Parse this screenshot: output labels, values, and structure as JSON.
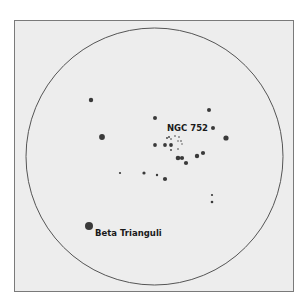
{
  "colors": {
    "background": "#ffffff",
    "field": "#ededed",
    "frame": "#7a7a7a",
    "circle": "#555555",
    "star": "#3a3a3a",
    "label": "#1a1a1a"
  },
  "field_of_view": {
    "cx": 154.5,
    "cy": 156.5,
    "r": 128.5
  },
  "labels": [
    {
      "id": "ngc752",
      "text": "NGC 752",
      "x": 167,
      "y": 131
    },
    {
      "id": "beta-tri",
      "text": "Beta Trianguli",
      "x": 95,
      "y": 236
    }
  ],
  "stars": [
    {
      "x": 89,
      "y": 226,
      "r": 4.0,
      "name": "Beta Trianguli"
    },
    {
      "x": 91,
      "y": 100,
      "r": 2.2
    },
    {
      "x": 102,
      "y": 137,
      "r": 2.9
    },
    {
      "x": 155,
      "y": 118,
      "r": 2.0
    },
    {
      "x": 209,
      "y": 110,
      "r": 2.0
    },
    {
      "x": 213,
      "y": 128,
      "r": 2.0
    },
    {
      "x": 226,
      "y": 138,
      "r": 2.6
    },
    {
      "x": 155,
      "y": 145,
      "r": 1.9
    },
    {
      "x": 165,
      "y": 145,
      "r": 1.9
    },
    {
      "x": 171,
      "y": 145,
      "r": 1.9
    },
    {
      "x": 178,
      "y": 158,
      "r": 2.3
    },
    {
      "x": 182,
      "y": 158,
      "r": 2.1
    },
    {
      "x": 186,
      "y": 163,
      "r": 2.1
    },
    {
      "x": 197,
      "y": 156,
      "r": 2.2
    },
    {
      "x": 203,
      "y": 153,
      "r": 2.1
    },
    {
      "x": 120,
      "y": 173,
      "r": 1.1
    },
    {
      "x": 144,
      "y": 173,
      "r": 1.6
    },
    {
      "x": 157,
      "y": 175,
      "r": 1.2
    },
    {
      "x": 165,
      "y": 179,
      "r": 2.1
    },
    {
      "x": 212,
      "y": 195,
      "r": 1.1
    },
    {
      "x": 212,
      "y": 202,
      "r": 1.3
    },
    {
      "x": 167,
      "y": 138,
      "r": 0.9
    },
    {
      "x": 169,
      "y": 137,
      "r": 0.9
    },
    {
      "x": 171,
      "y": 139,
      "r": 0.8
    },
    {
      "x": 175,
      "y": 136,
      "r": 0.8
    },
    {
      "x": 179,
      "y": 137,
      "r": 0.8
    },
    {
      "x": 181,
      "y": 141,
      "r": 0.8
    },
    {
      "x": 178,
      "y": 141,
      "r": 0.7
    },
    {
      "x": 182,
      "y": 144,
      "r": 0.7
    },
    {
      "x": 178,
      "y": 149,
      "r": 0.8
    },
    {
      "x": 171,
      "y": 150,
      "r": 0.9
    }
  ]
}
